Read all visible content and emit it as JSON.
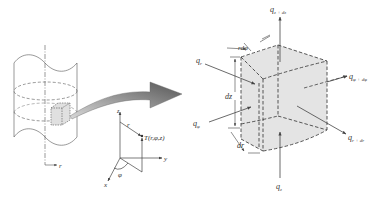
{
  "figure": {
    "cylinder": {
      "radial_axis_label": "r"
    },
    "coordinate_system": {
      "z_axis_label": "z",
      "y_axis_label": "y",
      "x_axis_label": "x",
      "radius_label": "r",
      "angle_label": "φ",
      "point_label": "T(r,φ,z)"
    },
    "element": {
      "flux_labels": {
        "q_z_dz": {
          "base": "q",
          "sub": "z + dz"
        },
        "q_r": {
          "base": "q",
          "sub": "r"
        },
        "q_phi": {
          "base": "q",
          "sub": "φ"
        },
        "q_phi_dphi": {
          "base": "q",
          "sub": "φ + dφ"
        },
        "q_r_dr": {
          "base": "q",
          "sub": "r + dr"
        },
        "q_z": {
          "base": "q",
          "sub": "z"
        }
      },
      "dimension_labels": {
        "rdphi": "rdφ",
        "dz": "dz",
        "dr": "dr"
      }
    },
    "colors": {
      "line": "#444444",
      "element_fill": "#e4e4e4",
      "arrow_dark": "#555555",
      "arrow_light": "#bbbbbb"
    }
  }
}
